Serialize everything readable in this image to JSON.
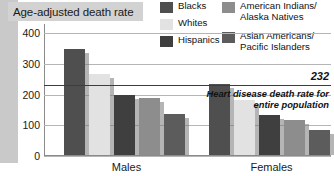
{
  "title": "Age-adjusted death rate",
  "legend": {
    "column1": [
      {
        "label": "Blacks",
        "color": "#4f4f4f"
      },
      {
        "label": "Whites",
        "color": "#e2e2e2"
      },
      {
        "label": "Hispanics",
        "color": "#3f3f3f"
      }
    ],
    "column2": [
      {
        "label": "American Indians/\nAlaska Natives",
        "color": "#8d8d8d"
      },
      {
        "label": "Asian Americans/\nPacific Islanders",
        "color": "#5c5c5c"
      }
    ]
  },
  "annotation": {
    "value": "232",
    "note": "Heart disease death rate for entire population"
  },
  "chart_data": {
    "type": "bar",
    "title": "Age-adjusted death rate",
    "xlabel": "",
    "ylabel": "Age-adjusted death rate",
    "categories": [
      "Males",
      "Females"
    ],
    "ylim": [
      0,
      430
    ],
    "yticks": [
      "0",
      "100",
      "200",
      "300",
      "400"
    ],
    "grid": true,
    "legend_position": "top-right",
    "reference_line": {
      "value": 232,
      "label": "Heart disease death rate for entire population"
    },
    "series": [
      {
        "name": "Blacks",
        "color": "#4f4f4f",
        "values": [
          345,
          230
        ]
      },
      {
        "name": "Whites",
        "color": "#e2e2e2",
        "values": [
          265,
          180
        ]
      },
      {
        "name": "Hispanics",
        "color": "#3f3f3f",
        "values": [
          195,
          130
        ]
      },
      {
        "name": "American Indians/Alaska Natives",
        "color": "#8d8d8d",
        "values": [
          185,
          115
        ]
      },
      {
        "name": "Asian Americans/Pacific Islanders",
        "color": "#5c5c5c",
        "values": [
          135,
          80
        ]
      }
    ]
  }
}
